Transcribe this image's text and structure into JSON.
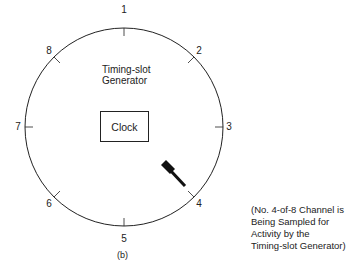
{
  "figure": {
    "title": "Timing-slot Generator",
    "clock_label": "Clock",
    "caption": "(b)",
    "note_lines": [
      "(No. 4-of-8 Channel is",
      "Being Sampled for",
      "Activity by the",
      "Timing-slot Generator)"
    ],
    "channels": [
      "1",
      "2",
      "3",
      "4",
      "5",
      "6",
      "7",
      "8"
    ],
    "active_channel": "4"
  }
}
